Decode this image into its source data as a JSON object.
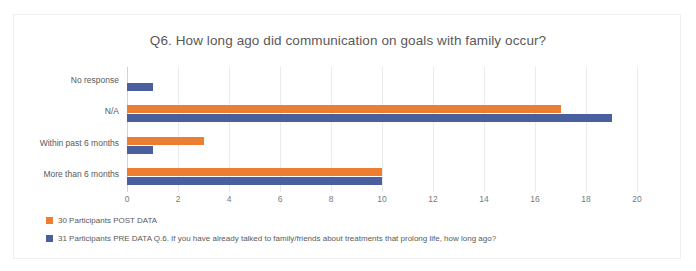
{
  "chart_data": {
    "type": "bar",
    "orientation": "horizontal",
    "title": "Q6. How long ago did communication on goals with family occur?",
    "xlabel": "",
    "ylabel": "",
    "categories": [
      "No response",
      "N/A",
      "Within past 6 months",
      "More than 6 months"
    ],
    "series": [
      {
        "name": "30 Participants POST DATA",
        "color": "#ED7D31",
        "values": [
          0,
          17,
          3,
          10
        ]
      },
      {
        "name": "31 Participants PRE DATA Q.6.  If you have already talked to family/friends about treatments that prolong life, how long ago?",
        "color": "#4A5F9E",
        "values": [
          1,
          19,
          1,
          10
        ]
      }
    ],
    "xlim": [
      0,
      20
    ],
    "xticks": [
      "0",
      "2",
      "4",
      "6",
      "8",
      "10",
      "12",
      "14",
      "16",
      "18",
      "20"
    ],
    "grid": true,
    "legend_position": "bottom-left"
  },
  "legend": {
    "items": [
      {
        "label": "30 Participants POST DATA",
        "color": "#ED7D31"
      },
      {
        "label": "31 Participants PRE DATA Q.6.  If you have already talked to family/friends about treatments that prolong life, how long ago?",
        "color": "#4A5F9E"
      }
    ]
  }
}
